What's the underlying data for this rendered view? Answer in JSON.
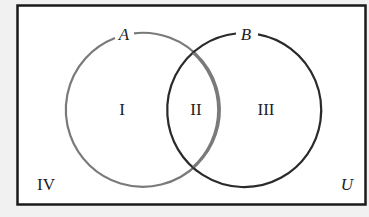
{
  "diagram": {
    "type": "venn",
    "universe": {
      "label": "U"
    },
    "sets": [
      {
        "label": "A",
        "stroke": "#7a7a7a"
      },
      {
        "label": "B",
        "stroke": "#2a2a2a"
      }
    ],
    "regions": [
      {
        "id": "I",
        "label": "I",
        "description": "A only"
      },
      {
        "id": "II",
        "label": "II",
        "description": "A and B"
      },
      {
        "id": "III",
        "label": "III",
        "description": "B only"
      },
      {
        "id": "IV",
        "label": "IV",
        "description": "neither A nor B"
      }
    ]
  },
  "colors": {
    "background": "#f1f1f1",
    "universe_fill": "#ffffff",
    "border": "#1a1a1a"
  }
}
